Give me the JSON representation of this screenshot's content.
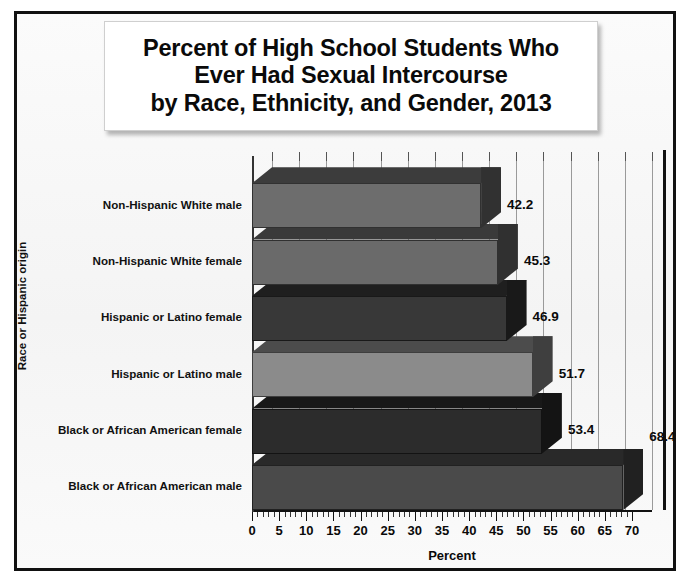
{
  "title": {
    "line1": "Percent of High School Students Who",
    "line2": "Ever Had Sexual Intercourse",
    "line3": "by Race, Ethnicity, and Gender, 2013"
  },
  "axes": {
    "ylabel": "Race or Hispanic origin",
    "xlabel": "Percent",
    "xticks": [
      "0",
      "5",
      "10",
      "15",
      "20",
      "25",
      "30",
      "35",
      "40",
      "45",
      "50",
      "55",
      "60",
      "65",
      "70"
    ]
  },
  "bars": [
    {
      "category": "Non-Hispanic White male",
      "value": 42.2,
      "value_label": "42.2",
      "color": "#6d6d6d"
    },
    {
      "category": "Non-Hispanic White female",
      "value": 45.3,
      "value_label": "45.3",
      "color": "#6a6a6a"
    },
    {
      "category": "Hispanic or Latino female",
      "value": 46.9,
      "value_label": "46.9",
      "color": "#383838"
    },
    {
      "category": "Hispanic or Latino male",
      "value": 51.7,
      "value_label": "51.7",
      "color": "#8b8b8b"
    },
    {
      "category": "Black or African American female",
      "value": 53.4,
      "value_label": "53.4",
      "color": "#2c2c2c"
    },
    {
      "category": "Black or African American male",
      "value": 68.4,
      "value_label": "68.4",
      "color": "#4a4a4a"
    }
  ],
  "chart_data": {
    "type": "bar",
    "orientation": "horizontal",
    "title": "Percent of High School Students Who Ever Had Sexual Intercourse by Race, Ethnicity, and Gender, 2013",
    "xlabel": "Percent",
    "ylabel": "Race or Hispanic origin",
    "xlim": [
      0,
      70
    ],
    "xtick_step": 5,
    "minor_tick_step": 1,
    "grid": "vertical",
    "legend": "none",
    "three_d": true,
    "categories": [
      "Non-Hispanic White male",
      "Non-Hispanic White female",
      "Hispanic or Latino female",
      "Hispanic or Latino male",
      "Black or African American female",
      "Black or African American male"
    ],
    "values": [
      42.2,
      45.3,
      46.9,
      51.7,
      53.4,
      68.4
    ],
    "data_labels": [
      "42.2",
      "45.3",
      "46.9",
      "51.7",
      "53.4",
      "68.4"
    ],
    "bar_colors": [
      "#6d6d6d",
      "#6a6a6a",
      "#383838",
      "#8b8b8b",
      "#2c2c2c",
      "#4a4a4a"
    ]
  }
}
